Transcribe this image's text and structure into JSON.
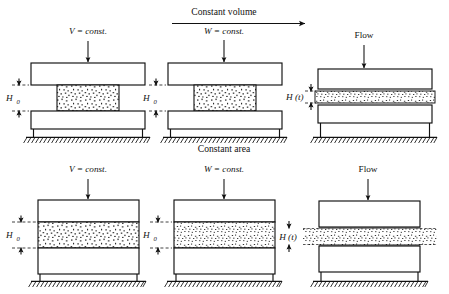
{
  "figure": {
    "rows": [
      {
        "row_label": "Constant volume",
        "row_sublabel": "W = const.",
        "panels": [
          {
            "id": "top-left",
            "load_label": "V = const.",
            "gap_label": "H",
            "gap_label_sub": "0",
            "arrow_icon": "down-arrow-icon",
            "sample_state": "undeformed",
            "geometry": "narrow-sample-between-plates"
          },
          {
            "id": "top-center",
            "load_label": "W = const.",
            "gap_label": "H",
            "gap_label_sub": "0",
            "arrow_icon": "down-arrow-icon",
            "sample_state": "undeformed",
            "geometry": "narrow-sample-between-plates"
          },
          {
            "id": "top-right",
            "load_label": "Flow",
            "gap_label": "H (t)",
            "gap_label_sub": "",
            "arrow_icon": "down-arrow-icon",
            "sample_state": "squeezed-spread",
            "geometry": "thin-wide-sample-between-plates"
          }
        ]
      },
      {
        "row_label": "Constant area",
        "row_sublabel": "W = const.",
        "panels": [
          {
            "id": "bottom-left",
            "load_label": "V = const.",
            "gap_label": "H",
            "gap_label_sub": "0",
            "arrow_icon": "down-arrow-icon",
            "sample_state": "undeformed",
            "geometry": "wide-sample-full-width"
          },
          {
            "id": "bottom-center",
            "load_label": "W = const.",
            "gap_label": "H",
            "gap_label_sub": "0",
            "arrow_icon": "down-arrow-icon",
            "sample_state": "undeformed",
            "geometry": "wide-sample-full-width"
          },
          {
            "id": "bottom-right",
            "load_label": "Flow",
            "gap_label": "H (t)",
            "gap_label_sub": "",
            "arrow_icon": "down-arrow-icon",
            "sample_state": "squeezed-extruded",
            "geometry": "thin-sample-extruding-past-plates"
          }
        ]
      }
    ],
    "row_arrow_icon": "right-arrow-icon",
    "ground_icon": "hatched-ground-icon",
    "dimension_icon": "double-headed-dimension-arrow-icon",
    "colors": {
      "line": "#111111",
      "background": "#ffffff",
      "speckle": "#1a1a1a"
    }
  }
}
